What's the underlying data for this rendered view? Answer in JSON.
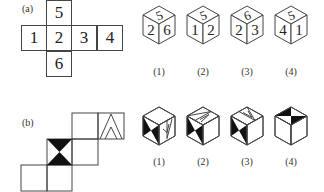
{
  "part_a": {
    "label": "(a)",
    "net": [
      {
        "face": "5",
        "col": 1,
        "row": 0
      },
      {
        "face": "1",
        "col": 0,
        "row": 1
      },
      {
        "face": "2",
        "col": 1,
        "row": 1
      },
      {
        "face": "3",
        "col": 2,
        "row": 1
      },
      {
        "face": "4",
        "col": 3,
        "row": 1
      },
      {
        "face": "6",
        "col": 1,
        "row": 2
      }
    ],
    "options": [
      {
        "label": "(1)",
        "top": "5",
        "left": "2",
        "right": "6"
      },
      {
        "label": "(2)",
        "top": "5",
        "left": "1",
        "right": "2"
      },
      {
        "label": "(3)",
        "top": "6",
        "left": "2",
        "right": "3"
      },
      {
        "label": "(4)",
        "top": "5",
        "left": "4",
        "right": "1"
      }
    ]
  },
  "part_b": {
    "label": "(b)",
    "net_faces": [
      {
        "pattern": "blank",
        "col": 2,
        "row": 0
      },
      {
        "pattern": "double-chevron",
        "col": 3,
        "row": 0
      },
      {
        "pattern": "bowtie",
        "col": 1,
        "row": 1
      },
      {
        "pattern": "blank",
        "col": 2,
        "row": 1
      },
      {
        "pattern": "blank",
        "col": 0,
        "row": 2
      },
      {
        "pattern": "blank",
        "col": 1,
        "row": 2
      }
    ],
    "options": [
      {
        "label": "(1)"
      },
      {
        "label": "(2)"
      },
      {
        "label": "(3)"
      },
      {
        "label": "(4)"
      }
    ]
  }
}
